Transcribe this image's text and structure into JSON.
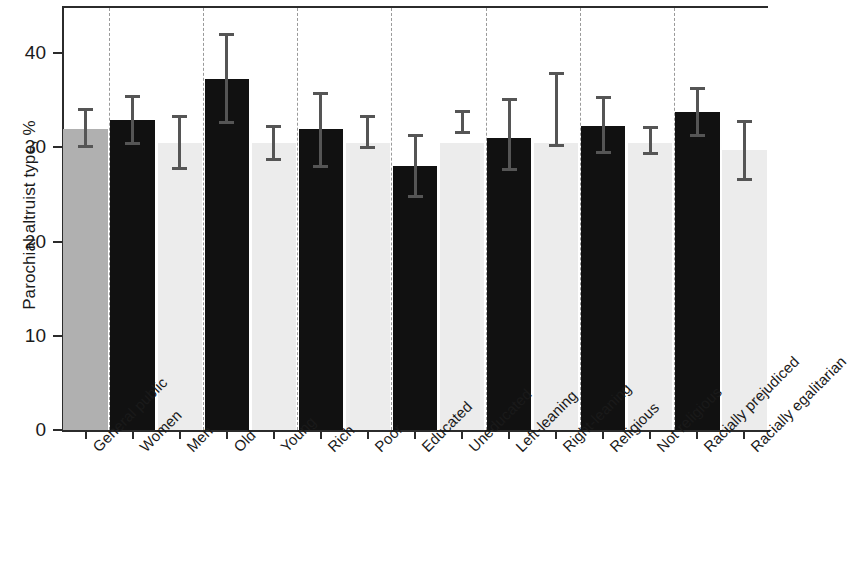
{
  "chart_data": {
    "type": "bar",
    "title": "",
    "xlabel": "",
    "ylabel": "Parochial altruist type, %",
    "ylim": [
      0,
      45
    ],
    "yticks": [
      0,
      10,
      20,
      30,
      40
    ],
    "ytick_labels": [
      "0",
      "10",
      "20",
      "30",
      "40"
    ],
    "grid": false,
    "legend": "none",
    "categories": [
      "General public",
      "Women",
      "Men",
      "Old",
      "Young",
      "Rich",
      "Poor",
      "Educated",
      "Uneducated",
      "Left-leaning",
      "Right-leaning",
      "Religious",
      "Not religious",
      "Racially prejudiced",
      "Racially egalitarian"
    ],
    "values": [
      32.0,
      32.9,
      30.5,
      37.3,
      30.5,
      31.9,
      30.5,
      28.0,
      30.5,
      31.0,
      30.5,
      32.3,
      30.5,
      33.8,
      29.7
    ],
    "error_low": [
      29.9,
      30.2,
      27.6,
      32.5,
      28.6,
      27.8,
      29.8,
      24.6,
      31.4,
      27.5,
      30.0,
      29.3,
      29.2,
      31.1,
      26.4
    ],
    "error_high": [
      34.2,
      35.6,
      33.4,
      42.1,
      32.4,
      35.9,
      33.4,
      31.4,
      34.0,
      35.2,
      38.0,
      35.4,
      32.3,
      36.4,
      32.9
    ],
    "bar_styles": [
      "gray",
      "black",
      "light",
      "black",
      "light",
      "black",
      "light",
      "black",
      "light",
      "black",
      "light",
      "black",
      "light",
      "black",
      "light"
    ],
    "group_separators_after": [
      0,
      2,
      4,
      6,
      8,
      10,
      12
    ],
    "colors": {
      "gray": "#b0b0b0",
      "black": "#111111",
      "light": "#ececec",
      "error": "#555555",
      "axis": "#2b2b2b",
      "separator": "#9a9a9a"
    }
  }
}
